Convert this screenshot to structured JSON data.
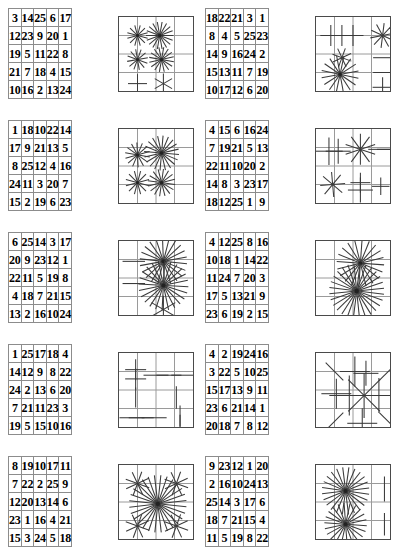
{
  "document": {
    "kind": "puzzle-worksheet",
    "page_width": 397,
    "page_height": 550,
    "columns": 2,
    "rows": 5,
    "colors": {
      "page_background": "#ffffff",
      "number_text": "#000000",
      "number_cell_border": "#8c8c8c",
      "number_grid_border": "#4a4a4a",
      "pattern_grid_line": "#9a9a9a",
      "pattern_ray": "#3a3a3a"
    }
  },
  "items": [
    {
      "id": "item-1",
      "position": {
        "row": 1,
        "col": 1,
        "x": 8,
        "y": 8
      },
      "number_grid": {
        "size": 5,
        "rows": [
          [
            "3",
            "14",
            "25",
            "6",
            "17"
          ],
          [
            "12",
            "23",
            "9",
            "20",
            "1"
          ],
          [
            "19",
            "5",
            "11",
            "22",
            "8"
          ],
          [
            "21",
            "7",
            "18",
            "4",
            "15"
          ],
          [
            "10",
            "16",
            "2",
            "13",
            "24"
          ]
        ]
      },
      "pattern_grid": {
        "size": 4,
        "x": 118,
        "y": 16,
        "bursts": [
          {
            "cx": 0.5,
            "cy": 0.5,
            "rays": 6,
            "len": 0.42,
            "rot": 15
          },
          {
            "cx": 1.7,
            "cy": 0.5,
            "rays": 9,
            "len": 0.55,
            "rot": 0
          },
          {
            "cx": 0.5,
            "cy": 1.8,
            "rays": 6,
            "len": 0.42,
            "rot": 20
          },
          {
            "cx": 1.8,
            "cy": 1.8,
            "rays": 8,
            "len": 0.5,
            "rot": 10
          },
          {
            "cx": 0.5,
            "cy": 3.1,
            "rays": 2,
            "len": 0.38,
            "rot": 90
          },
          {
            "cx": 1.9,
            "cy": 3.1,
            "rays": 3,
            "len": 0.4,
            "rot": 90
          }
        ]
      }
    },
    {
      "id": "item-2",
      "position": {
        "row": 1,
        "col": 2,
        "x": 205,
        "y": 8
      },
      "number_grid": {
        "size": 5,
        "rows": [
          [
            "18",
            "22",
            "21",
            "3",
            "1"
          ],
          [
            "8",
            "4",
            "5",
            "25",
            "23"
          ],
          [
            "14",
            "9",
            "16",
            "24",
            "2"
          ],
          [
            "15",
            "13",
            "11",
            "7",
            "19"
          ],
          [
            "10",
            "17",
            "12",
            "6",
            "20"
          ]
        ]
      },
      "pattern_grid": {
        "size": 4,
        "x": 315,
        "y": 16,
        "bursts": [
          {
            "cx": 0.3,
            "cy": 0.5,
            "rays": 2,
            "len": 0.42,
            "rot": 0
          },
          {
            "cx": 0.9,
            "cy": 0.5,
            "rays": 2,
            "len": 0.42,
            "rot": 0
          },
          {
            "cx": 1.5,
            "cy": 0.5,
            "rays": 2,
            "len": 0.42,
            "rot": 0
          },
          {
            "cx": 3.1,
            "cy": 0.5,
            "rays": 5,
            "len": 0.5,
            "rot": 25
          },
          {
            "cx": 0.9,
            "cy": 1.7,
            "rays": 4,
            "len": 0.4,
            "rot": 20
          },
          {
            "cx": 3.1,
            "cy": 1.7,
            "rays": 1,
            "len": 0.38,
            "rot": 0
          },
          {
            "cx": 0.8,
            "cy": 2.6,
            "rays": 8,
            "len": 0.75,
            "rot": 12
          },
          {
            "cx": 3.1,
            "cy": 2.5,
            "rays": 1,
            "len": 0.38,
            "rot": 0
          },
          {
            "cx": 3.1,
            "cy": 3.3,
            "rays": 2,
            "len": 0.4,
            "rot": 0
          }
        ]
      }
    },
    {
      "id": "item-3",
      "position": {
        "row": 2,
        "col": 1,
        "x": 8,
        "y": 120
      },
      "number_grid": {
        "size": 5,
        "rows": [
          [
            "1",
            "18",
            "10",
            "22",
            "14"
          ],
          [
            "17",
            "9",
            "21",
            "13",
            "5"
          ],
          [
            "8",
            "25",
            "12",
            "4",
            "16"
          ],
          [
            "24",
            "11",
            "3",
            "20",
            "7"
          ],
          [
            "15",
            "2",
            "19",
            "6",
            "23"
          ]
        ]
      },
      "pattern_grid": {
        "size": 4,
        "x": 118,
        "y": 128,
        "bursts": [
          {
            "cx": 0.5,
            "cy": 0.9,
            "rays": 7,
            "len": 0.5,
            "rot": 10
          },
          {
            "cx": 1.8,
            "cy": 0.8,
            "rays": 10,
            "len": 0.7,
            "rot": 5
          },
          {
            "cx": 0.5,
            "cy": 2.4,
            "rays": 6,
            "len": 0.48,
            "rot": 15
          },
          {
            "cx": 1.8,
            "cy": 2.4,
            "rays": 8,
            "len": 0.55,
            "rot": 8
          }
        ]
      }
    },
    {
      "id": "item-4",
      "position": {
        "row": 2,
        "col": 2,
        "x": 205,
        "y": 120
      },
      "number_grid": {
        "size": 5,
        "rows": [
          [
            "4",
            "15",
            "6",
            "16",
            "24"
          ],
          [
            "7",
            "19",
            "21",
            "5",
            "13"
          ],
          [
            "22",
            "11",
            "10",
            "20",
            "2"
          ],
          [
            "14",
            "8",
            "3",
            "23",
            "17"
          ],
          [
            "18",
            "12",
            "25",
            "1",
            "9"
          ]
        ]
      },
      "pattern_grid": {
        "size": 4,
        "x": 315,
        "y": 128,
        "bursts": [
          {
            "cx": 0.2,
            "cy": 0.7,
            "rays": 2,
            "len": 0.55,
            "rot": 0
          },
          {
            "cx": 0.7,
            "cy": 0.7,
            "rays": 2,
            "len": 0.5,
            "rot": 0
          },
          {
            "cx": 1.9,
            "cy": 0.6,
            "rays": 5,
            "len": 0.62,
            "rot": 18
          },
          {
            "cx": 3.0,
            "cy": 0.6,
            "rays": 1,
            "len": 0.5,
            "rot": 0
          },
          {
            "cx": 3.4,
            "cy": 0.6,
            "rays": 1,
            "len": 0.45,
            "rot": 0
          },
          {
            "cx": 0.4,
            "cy": 2.5,
            "rays": 4,
            "len": 0.5,
            "rot": 40
          },
          {
            "cx": 1.9,
            "cy": 2.4,
            "rays": 2,
            "len": 0.4,
            "rot": 90
          },
          {
            "cx": 1.9,
            "cy": 2.8,
            "rays": 2,
            "len": 0.5,
            "rot": 90
          },
          {
            "cx": 3.0,
            "cy": 2.6,
            "rays": 2,
            "len": 0.35,
            "rot": 0
          }
        ]
      }
    },
    {
      "id": "item-5",
      "position": {
        "row": 3,
        "col": 1,
        "x": 8,
        "y": 232
      },
      "number_grid": {
        "size": 5,
        "rows": [
          [
            "6",
            "25",
            "14",
            "3",
            "17"
          ],
          [
            "20",
            "9",
            "23",
            "12",
            "1"
          ],
          [
            "22",
            "11",
            "5",
            "19",
            "8"
          ],
          [
            "4",
            "18",
            "7",
            "21",
            "15"
          ],
          [
            "13",
            "2",
            "16",
            "10",
            "24"
          ]
        ]
      },
      "pattern_grid": {
        "size": 4,
        "x": 118,
        "y": 240,
        "bursts": [
          {
            "cx": 0.3,
            "cy": 0.6,
            "rays": 1,
            "len": 0.45,
            "rot": 0
          },
          {
            "cx": 1.9,
            "cy": 0.6,
            "rays": 11,
            "len": 0.95,
            "rot": 6
          },
          {
            "cx": 0.3,
            "cy": 1.8,
            "rays": 1,
            "len": 0.45,
            "rot": 0
          },
          {
            "cx": 1.9,
            "cy": 1.9,
            "rays": 12,
            "len": 1.0,
            "rot": 3
          },
          {
            "cx": 1.9,
            "cy": 3.2,
            "rays": 3,
            "len": 0.55,
            "rot": 90
          }
        ]
      }
    },
    {
      "id": "item-6",
      "position": {
        "row": 3,
        "col": 2,
        "x": 205,
        "y": 232
      },
      "number_grid": {
        "size": 5,
        "rows": [
          [
            "4",
            "12",
            "25",
            "8",
            "16"
          ],
          [
            "10",
            "18",
            "1",
            "14",
            "22"
          ],
          [
            "11",
            "24",
            "7",
            "20",
            "3"
          ],
          [
            "17",
            "5",
            "13",
            "21",
            "9"
          ],
          [
            "23",
            "6",
            "19",
            "2",
            "15"
          ]
        ]
      },
      "pattern_grid": {
        "size": 4,
        "x": 315,
        "y": 240,
        "bursts": [
          {
            "cx": 1.9,
            "cy": 0.7,
            "rays": 10,
            "len": 0.95,
            "rot": 4
          },
          {
            "cx": 1.7,
            "cy": 2.2,
            "rays": 14,
            "len": 1.1,
            "rot": 7
          }
        ]
      }
    },
    {
      "id": "item-7",
      "position": {
        "row": 4,
        "col": 1,
        "x": 8,
        "y": 344
      },
      "number_grid": {
        "size": 5,
        "rows": [
          [
            "1",
            "25",
            "17",
            "18",
            "4"
          ],
          [
            "14",
            "12",
            "9",
            "8",
            "22"
          ],
          [
            "24",
            "2",
            "13",
            "6",
            "20"
          ],
          [
            "7",
            "21",
            "11",
            "23",
            "3"
          ],
          [
            "19",
            "5",
            "15",
            "10",
            "16"
          ]
        ]
      },
      "pattern_grid": {
        "size": 4,
        "x": 118,
        "y": 352,
        "bursts": [
          {
            "cx": 0.4,
            "cy": 0.4,
            "rays": 2,
            "len": 0.42,
            "rot": 90
          },
          {
            "cx": 0.4,
            "cy": 0.9,
            "rays": 2,
            "len": 0.42,
            "rot": 90
          },
          {
            "cx": 1.5,
            "cy": 0.7,
            "rays": 1,
            "len": 0.5,
            "rot": 0
          },
          {
            "cx": 2.2,
            "cy": 0.7,
            "rays": 1,
            "len": 0.5,
            "rot": 0
          },
          {
            "cx": 3.0,
            "cy": 0.7,
            "rays": 1,
            "len": 0.5,
            "rot": 0
          },
          {
            "cx": 0.4,
            "cy": 1.9,
            "rays": 1,
            "len": 0.4,
            "rot": 90
          },
          {
            "cx": 2.6,
            "cy": 1.9,
            "rays": 1,
            "len": 0.45,
            "rot": 90
          },
          {
            "cx": 0.2,
            "cy": 3.0,
            "rays": 1,
            "len": 0.5,
            "rot": 0
          },
          {
            "cx": 0.7,
            "cy": 3.0,
            "rays": 1,
            "len": 0.5,
            "rot": 0
          },
          {
            "cx": 1.4,
            "cy": 3.0,
            "rays": 1,
            "len": 0.5,
            "rot": 0
          },
          {
            "cx": 2.8,
            "cy": 2.9,
            "rays": 1,
            "len": 0.42,
            "rot": 90
          },
          {
            "cx": 2.8,
            "cy": 3.4,
            "rays": 1,
            "len": 0.42,
            "rot": 90
          }
        ]
      }
    },
    {
      "id": "item-8",
      "position": {
        "row": 4,
        "col": 2,
        "x": 205,
        "y": 344
      },
      "number_grid": {
        "size": 5,
        "rows": [
          [
            "4",
            "2",
            "19",
            "24",
            "16"
          ],
          [
            "3",
            "22",
            "5",
            "10",
            "25"
          ],
          [
            "15",
            "17",
            "13",
            "9",
            "11"
          ],
          [
            "23",
            "6",
            "21",
            "14",
            "1"
          ],
          [
            "20",
            "18",
            "7",
            "8",
            "12"
          ]
        ]
      },
      "pattern_grid": {
        "size": 4,
        "x": 315,
        "y": 352,
        "bursts": [
          {
            "cx": 0.5,
            "cy": 0.5,
            "rays": 1,
            "len": 0.5,
            "rot": 45
          },
          {
            "cx": 3.4,
            "cy": 0.5,
            "rays": 1,
            "len": 0.5,
            "rot": 135
          },
          {
            "cx": 1.6,
            "cy": 0.5,
            "rays": 2,
            "len": 0.6,
            "rot": 90
          },
          {
            "cx": 2.2,
            "cy": 0.6,
            "rays": 2,
            "len": 0.5,
            "rot": 0
          },
          {
            "cx": 0.6,
            "cy": 1.7,
            "rays": 2,
            "len": 0.6,
            "rot": 0
          },
          {
            "cx": 1.3,
            "cy": 1.8,
            "rays": 2,
            "len": 0.8,
            "rot": 90
          },
          {
            "cx": 2.1,
            "cy": 1.8,
            "rays": 4,
            "len": 0.9,
            "rot": 0
          },
          {
            "cx": 2.9,
            "cy": 1.8,
            "rays": 2,
            "len": 0.7,
            "rot": 0
          },
          {
            "cx": 0.5,
            "cy": 3.2,
            "rays": 1,
            "len": 0.5,
            "rot": 135
          },
          {
            "cx": 3.4,
            "cy": 3.2,
            "rays": 1,
            "len": 0.5,
            "rot": 45
          },
          {
            "cx": 2.0,
            "cy": 3.3,
            "rays": 2,
            "len": 0.6,
            "rot": 0
          }
        ]
      }
    },
    {
      "id": "item-9",
      "position": {
        "row": 5,
        "col": 1,
        "x": 8,
        "y": 456
      },
      "number_grid": {
        "size": 5,
        "rows": [
          [
            "8",
            "19",
            "10",
            "17",
            "11"
          ],
          [
            "7",
            "22",
            "2",
            "25",
            "9"
          ],
          [
            "12",
            "20",
            "13",
            "14",
            "6"
          ],
          [
            "23",
            "1",
            "16",
            "4",
            "21"
          ],
          [
            "15",
            "3",
            "24",
            "5",
            "18"
          ]
        ]
      },
      "pattern_grid": {
        "size": 4,
        "x": 118,
        "y": 464,
        "bursts": [
          {
            "cx": 0.5,
            "cy": 0.5,
            "rays": 4,
            "len": 0.5,
            "rot": 20
          },
          {
            "cx": 2.6,
            "cy": 0.5,
            "rays": 4,
            "len": 0.5,
            "rot": 20
          },
          {
            "cx": 1.6,
            "cy": 1.6,
            "rays": 14,
            "len": 1.15,
            "rot": 6
          },
          {
            "cx": 0.5,
            "cy": 2.8,
            "rays": 4,
            "len": 0.5,
            "rot": 20
          },
          {
            "cx": 2.6,
            "cy": 2.8,
            "rays": 4,
            "len": 0.5,
            "rot": 20
          }
        ]
      }
    },
    {
      "id": "item-10",
      "position": {
        "row": 5,
        "col": 2,
        "x": 205,
        "y": 456
      },
      "number_grid": {
        "size": 5,
        "rows": [
          [
            "9",
            "23",
            "12",
            "1",
            "20"
          ],
          [
            "2",
            "16",
            "10",
            "24",
            "13"
          ],
          [
            "25",
            "14",
            "3",
            "17",
            "6"
          ],
          [
            "18",
            "7",
            "21",
            "15",
            "4"
          ],
          [
            "11",
            "5",
            "19",
            "8",
            "22"
          ]
        ]
      },
      "pattern_grid": {
        "size": 4,
        "x": 315,
        "y": 464,
        "bursts": [
          {
            "cx": 1.1,
            "cy": 0.9,
            "rays": 12,
            "len": 0.95,
            "rot": 8
          },
          {
            "cx": 3.2,
            "cy": 0.8,
            "rays": 1,
            "len": 0.5,
            "rot": 90
          },
          {
            "cx": 1.1,
            "cy": 2.7,
            "rays": 11,
            "len": 0.85,
            "rot": 4
          },
          {
            "cx": 3.2,
            "cy": 2.7,
            "rays": 1,
            "len": 0.45,
            "rot": 90
          }
        ]
      }
    }
  ]
}
